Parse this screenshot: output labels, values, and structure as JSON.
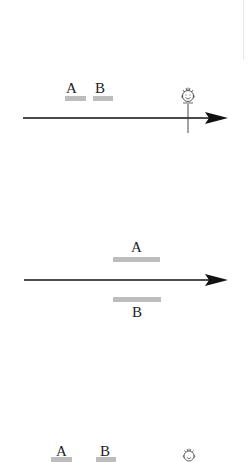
{
  "colors": {
    "bar": "#bdbdbd",
    "line": "#111111",
    "background": "#ffffff"
  },
  "panels": [
    {
      "id": "panel-1",
      "description": "A and B events before observer on timeline",
      "labels": {
        "a": "A",
        "b": "B"
      },
      "observer_icon": "smiley-observer-icon"
    },
    {
      "id": "panel-2",
      "description": "A above and B below timeline, simultaneous",
      "labels": {
        "a": "A",
        "b": "B"
      }
    },
    {
      "id": "panel-3",
      "description": "A and B events with observer (cropped)",
      "labels": {
        "a": "A",
        "b": "B"
      },
      "observer_icon": "smiley-observer-icon"
    }
  ]
}
